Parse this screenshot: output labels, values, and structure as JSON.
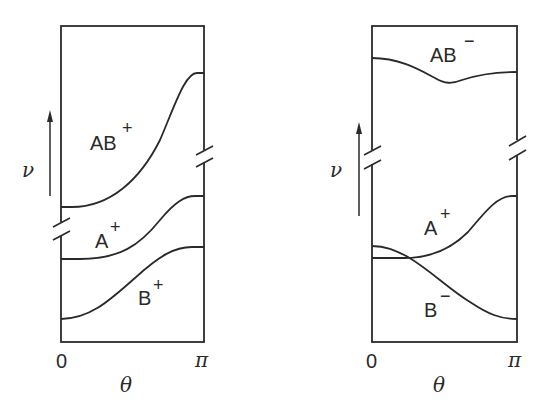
{
  "figure": {
    "panels": [
      {
        "id": "left",
        "y_axis_label": "ν",
        "x_axis_label": "θ",
        "x_ticks": [
          "0",
          "π"
        ],
        "curves": [
          {
            "name": "AB+",
            "base": "AB",
            "sign": "+",
            "trend": "rises from low plateau at θ=0 to high plateau at θ=π"
          },
          {
            "name": "A+",
            "base": "A",
            "sign": "+",
            "trend": "rises from θ=0 to θ=π"
          },
          {
            "name": "B+",
            "base": "B",
            "sign": "+",
            "trend": "rises from θ=0 to θ=π"
          }
        ],
        "axis_breaks": [
          "left edge between AB+ and A+",
          "right edge between AB+ and A+"
        ]
      },
      {
        "id": "right",
        "y_axis_label": "ν",
        "x_axis_label": "θ",
        "x_ticks": [
          "0",
          "π"
        ],
        "curves": [
          {
            "name": "AB−",
            "base": "AB",
            "sign": "−",
            "trend": "dips to minimum near middle then levels off"
          },
          {
            "name": "A+",
            "base": "A",
            "sign": "+",
            "trend": "flat then rises to θ=π"
          },
          {
            "name": "B−",
            "base": "B",
            "sign": "−",
            "trend": "starts slightly above A+, crosses it, descends to θ=π"
          }
        ],
        "axis_breaks": [
          "left edge between AB− and A+",
          "right edge between AB− and A+"
        ]
      }
    ]
  },
  "labels": {
    "left": {
      "nu": "ν",
      "theta": "θ",
      "zero": "0",
      "pi": "π",
      "ab_base": "AB",
      "ab_sign": "+",
      "a_base": "A",
      "a_sign": "+",
      "b_base": "B",
      "b_sign": "+"
    },
    "right": {
      "nu": "ν",
      "theta": "θ",
      "zero": "0",
      "pi": "π",
      "ab_base": "AB",
      "ab_sign": "−",
      "a_base": "A",
      "a_sign": "+",
      "b_base": "B",
      "b_sign": "−"
    }
  },
  "colors": {
    "ink": "#2a2a2a",
    "background": "#ffffff"
  }
}
